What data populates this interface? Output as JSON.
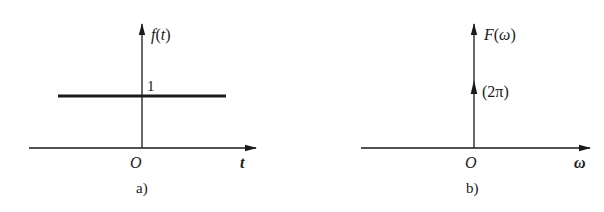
{
  "panels": [
    {
      "id": "a",
      "caption": "a)",
      "y_axis_label": "f(t)",
      "y_axis_label_parts": {
        "func": "f",
        "open": "(",
        "var": "t",
        "close": ")"
      },
      "x_axis_label": "t",
      "origin_label": "O",
      "level_label": "1",
      "description": "constant signal f(t) = 1"
    },
    {
      "id": "b",
      "caption": "b)",
      "y_axis_label": "F(ω)",
      "y_axis_label_parts": {
        "func": "F",
        "open": "(",
        "var": "ω",
        "close": ")"
      },
      "x_axis_label": "ω",
      "origin_label": "O",
      "impulse_label": "(2π)",
      "description": "impulse 2πδ(ω) at origin"
    }
  ],
  "colors": {
    "stroke": "#1a1a1a",
    "background": "#ffffff"
  }
}
